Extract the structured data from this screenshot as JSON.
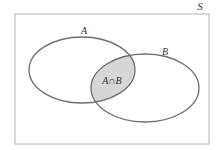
{
  "diagram": {
    "type": "venn",
    "universe_label": "S",
    "sets": [
      {
        "id": "A",
        "label": "A"
      },
      {
        "id": "B",
        "label": "B"
      }
    ],
    "intersection": {
      "label": "A∩B",
      "shaded": true
    },
    "colors": {
      "outline": "#6e6e6e",
      "universe_outline": "#b4b4b4",
      "intersection_fill": "#d6d6d6",
      "background": "#ffffff"
    }
  }
}
